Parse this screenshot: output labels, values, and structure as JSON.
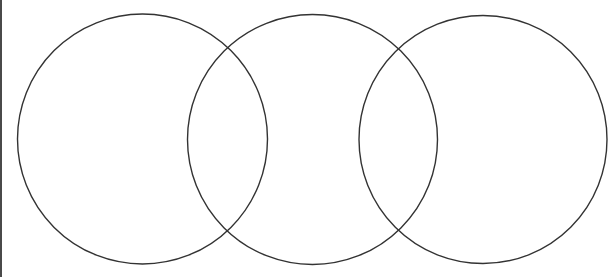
{
  "diagram": {
    "type": "venn",
    "title": "",
    "background": "#ffffff",
    "stroke_color": "#333333",
    "stroke_width": 1.4,
    "border_color": "#4a4a4a",
    "circles": [
      {
        "name": "circle-left",
        "cx": 142.5,
        "cy": 139,
        "r": 125,
        "label": ""
      },
      {
        "name": "circle-middle",
        "cx": 312.5,
        "cy": 139.5,
        "r": 125,
        "label": ""
      },
      {
        "name": "circle-right",
        "cx": 483,
        "cy": 139.5,
        "r": 124,
        "label": ""
      }
    ]
  }
}
